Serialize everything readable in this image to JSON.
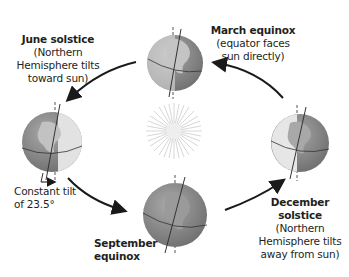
{
  "diagram": {
    "type": "earth-orbit-seasons",
    "center": {
      "name": "sun",
      "icon": "sun-icon"
    },
    "positions": [
      {
        "id": "march",
        "title": "March equinox",
        "desc_lines": [
          "(equator faces",
          "sun directly)"
        ]
      },
      {
        "id": "june",
        "title": "June solstice",
        "desc_lines": [
          "(Northern",
          "Hemisphere tilts",
          "toward sun)"
        ]
      },
      {
        "id": "september",
        "title_lines": [
          "September",
          "equinox"
        ]
      },
      {
        "id": "december",
        "title_lines": [
          "December",
          "solstice"
        ],
        "desc_lines": [
          "(Northern",
          "Hemisphere tilts",
          "away from sun)"
        ]
      }
    ],
    "tilt_note": {
      "lines": [
        "Constant tilt",
        "of 23.5°"
      ]
    },
    "orbit_direction": "counterclockwise",
    "colors": {
      "ocean": "#8f8f8f",
      "land": "#b9b9b9",
      "night": "#e6e6e6",
      "arrow": "#1a1a1a",
      "sun_rays": "#d7d7d7"
    }
  }
}
